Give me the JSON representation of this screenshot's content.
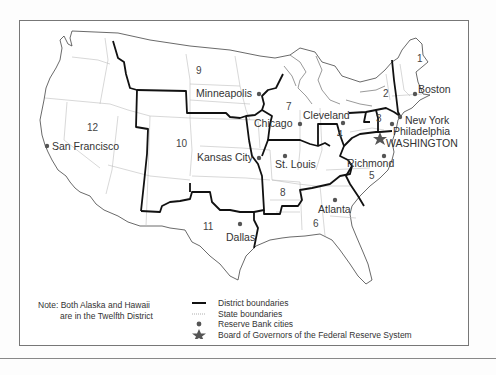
{
  "map": {
    "title": "Federal Reserve Districts",
    "districts": [
      {
        "number": "1",
        "x": 417,
        "y": 54
      },
      {
        "number": "2",
        "x": 383,
        "y": 89
      },
      {
        "number": "3",
        "x": 375,
        "y": 115
      },
      {
        "number": "4",
        "x": 337,
        "y": 130
      },
      {
        "number": "5",
        "x": 369,
        "y": 171
      },
      {
        "number": "6",
        "x": 313,
        "y": 218
      },
      {
        "number": "7",
        "x": 286,
        "y": 102
      },
      {
        "number": "8",
        "x": 280,
        "y": 189
      },
      {
        "number": "9",
        "x": 196,
        "y": 66
      },
      {
        "number": "10",
        "x": 176,
        "y": 138
      },
      {
        "number": "11",
        "x": 203,
        "y": 222
      },
      {
        "number": "12",
        "x": 87,
        "y": 123
      }
    ],
    "cities": [
      {
        "name": "Boston",
        "dot_x": 415,
        "dot_y": 94,
        "label_x": 418,
        "label_y": 84
      },
      {
        "name": "New York",
        "dot_x": 400,
        "dot_y": 116,
        "label_x": 405,
        "label_y": 115
      },
      {
        "name": "Philadelphia",
        "dot_x": 392,
        "dot_y": 123,
        "label_x": 393,
        "label_y": 126
      },
      {
        "name": "Cleveland",
        "dot_x": 343,
        "dot_y": 122,
        "label_x": 303,
        "label_y": 110
      },
      {
        "name": "Richmond",
        "dot_x": 384,
        "dot_y": 156,
        "label_x": 346,
        "label_y": 158
      },
      {
        "name": "Atlanta",
        "dot_x": 335,
        "dot_y": 199,
        "label_x": 318,
        "label_y": 203
      },
      {
        "name": "Chicago",
        "dot_x": 300,
        "dot_y": 123,
        "label_x": 255,
        "label_y": 118
      },
      {
        "name": "St. Louis",
        "dot_x": 285,
        "dot_y": 155,
        "label_x": 274,
        "label_y": 159
      },
      {
        "name": "Minneapolis",
        "dot_x": 259,
        "dot_y": 94,
        "label_x": 196,
        "label_y": 88
      },
      {
        "name": "Kansas City",
        "dot_x": 259,
        "dot_y": 157,
        "label_x": 197,
        "label_y": 152
      },
      {
        "name": "Dallas",
        "dot_x": 240,
        "dot_y": 224,
        "label_x": 226,
        "label_y": 232
      },
      {
        "name": "San Francisco",
        "dot_x": 47,
        "dot_y": 146,
        "label_x": 52,
        "label_y": 141
      }
    ],
    "capital": {
      "name": "WASHINGTON",
      "x": 380,
      "y": 139,
      "label_x": 385,
      "label_y": 138
    }
  },
  "note": {
    "line1": "Note: Both Alaska and Hawaii",
    "line2": "are in the Twelfth District"
  },
  "legend": {
    "items": [
      {
        "symbol": "thick-line",
        "label": "District boundaries"
      },
      {
        "symbol": "dotted-line",
        "label": "State boundaries"
      },
      {
        "symbol": "dot",
        "label": "Reserve Bank cities"
      },
      {
        "symbol": "star",
        "label": "Board of Governors of the Federal Reserve System"
      }
    ]
  },
  "colors": {
    "district_line": "#111111",
    "state_line": "#bbbbbb",
    "coast": "#444444",
    "dot": "#555555"
  }
}
